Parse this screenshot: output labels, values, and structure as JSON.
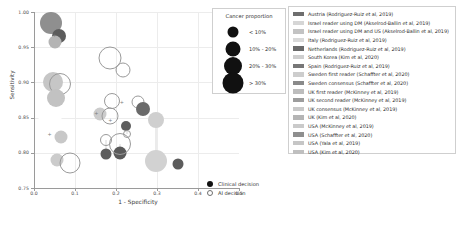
{
  "chart_data": {
    "type": "scatter",
    "title": "",
    "xlabel": "1 - Specificity",
    "ylabel": "Sensitivity",
    "xlim": [
      0.0,
      0.5
    ],
    "ylim": [
      0.75,
      1.0
    ],
    "xticks": [
      "0.0",
      "0.1",
      "0.2",
      "0.3",
      "0.4",
      "0.5"
    ],
    "xtick_values": [
      0.0,
      0.1,
      0.2,
      0.3,
      0.4,
      0.5
    ],
    "yticks": [
      "0.75",
      "0.80",
      "0.85",
      "0.90",
      "0.95",
      "1.00"
    ],
    "ytick_values": [
      0.75,
      0.8,
      0.85,
      0.9,
      0.95,
      1.0
    ],
    "grid": true,
    "legend_position": "right",
    "size_encodes": "Cancer proportion",
    "shape_encodes": "decision type",
    "points": [
      {
        "study": "Austria (Rodriguez-Ruiz et al, 2019)",
        "decision": "Clinical decision",
        "x": 0.041,
        "y": 0.985,
        "size": 22,
        "color": "#8f8f8f"
      },
      {
        "study": "Austria (Rodriguez-Ruiz et al, 2019)",
        "decision": "Clinical decision",
        "x": 0.06,
        "y": 0.966,
        "size": 14,
        "color": "#5c5c5c"
      },
      {
        "study": "Israel reader using DM (Akselrod-Ballin et al, 2019)",
        "decision": "Clinical decision",
        "x": 0.052,
        "y": 0.958,
        "size": 13,
        "color": "#b4b4b4"
      },
      {
        "study": "Israel reader using DM and US (Akselrod-Ballin et al, 2019)",
        "decision": "AI decision",
        "x": 0.186,
        "y": 0.934,
        "size": 23,
        "color": "#c9c9c9"
      },
      {
        "study": "Italy (Rodriguez-Ruiz et al, 2019)",
        "decision": "AI decision",
        "x": 0.216,
        "y": 0.918,
        "size": 15,
        "color": "#c4c4c4"
      },
      {
        "study": "Netherlands (Rodriguez-Ruiz et al, 2019)",
        "decision": "Clinical decision",
        "x": 0.047,
        "y": 0.9,
        "size": 20,
        "color": "#c6c6c6"
      },
      {
        "study": "Netherlands (Rodriguez-Ruiz et al, 2019)",
        "decision": "AI decision",
        "x": 0.064,
        "y": 0.898,
        "size": 22,
        "color": "#ffffff"
      },
      {
        "study": "South Korea (Kim et al, 2020)",
        "decision": "Clinical decision",
        "x": 0.054,
        "y": 0.878,
        "size": 18,
        "color": "#c2c2c2"
      },
      {
        "study": "Spain (Rodriguez-Ruiz et al, 2019)",
        "decision": "AI decision",
        "x": 0.191,
        "y": 0.874,
        "size": 16,
        "color": "#ffffff"
      },
      {
        "study": "Sweden first reader (Schaffter et al, 2020)",
        "decision": "AI decision",
        "x": 0.253,
        "y": 0.872,
        "size": 13,
        "color": "#ffffff"
      },
      {
        "study": "Sweden consensus (Schaffter et al, 2020)",
        "decision": "Clinical decision",
        "x": 0.266,
        "y": 0.862,
        "size": 14,
        "color": "#6a6a6a"
      },
      {
        "study": "UK first reader (McKinney et al, 2019)",
        "decision": "Clinical decision",
        "x": 0.16,
        "y": 0.855,
        "size": 13,
        "color": "#cccccc"
      },
      {
        "study": "UK second reader (McKinney et al, 2019)",
        "decision": "AI decision",
        "x": 0.186,
        "y": 0.852,
        "size": 17,
        "color": "#ffffff"
      },
      {
        "study": "UK consensus (McKinney et al, 2019)",
        "decision": "Clinical decision",
        "x": 0.04,
        "y": 0.848,
        "size": 23,
        "color": "#ffffff"
      },
      {
        "study": "UK (Kim et al, 2020)",
        "decision": "Clinical decision",
        "x": 0.225,
        "y": 0.838,
        "size": 10,
        "color": "#5e5e5e"
      },
      {
        "study": "USA (McKinney et al, 2019)",
        "decision": "AI decision",
        "x": 0.228,
        "y": 0.826,
        "size": 8,
        "color": "#ffffff"
      },
      {
        "study": "USA (Schaffter et al, 2020)",
        "decision": "Clinical decision",
        "x": 0.297,
        "y": 0.846,
        "size": 16,
        "color": "#cfcfcf"
      },
      {
        "study": "USA (Yala et al, 2019)",
        "decision": "Clinical decision",
        "x": 0.066,
        "y": 0.823,
        "size": 13,
        "color": "#c8c8c8"
      },
      {
        "study": "USA (Kim et al, 2020)",
        "decision": "AI decision",
        "x": 0.175,
        "y": 0.818,
        "size": 12,
        "color": "#ffffff"
      },
      {
        "study": "USA (Kim et al, 2020)",
        "decision": "Clinical decision",
        "x": 0.176,
        "y": 0.798,
        "size": 11,
        "color": "#5e5e5e"
      },
      {
        "study": "Sweden consensus (Schaffter et al, 2020)",
        "decision": "Clinical decision",
        "x": 0.21,
        "y": 0.8,
        "size": 13,
        "color": "#5a5a5a"
      },
      {
        "study": "UK (Kim et al, 2020)",
        "decision": "AI decision",
        "x": 0.21,
        "y": 0.812,
        "size": 22,
        "color": "#ffffff"
      },
      {
        "study": "Italy (Rodriguez-Ruiz et al, 2019)",
        "decision": "Clinical decision",
        "x": 0.056,
        "y": 0.79,
        "size": 13,
        "color": "#cbcbcb"
      },
      {
        "study": "Spain (Rodriguez-Ruiz et al, 2019)",
        "decision": "AI decision",
        "x": 0.087,
        "y": 0.786,
        "size": 21,
        "color": "#ffffff"
      },
      {
        "study": "USA (Schaffter et al, 2020)",
        "decision": "Clinical decision",
        "x": 0.297,
        "y": 0.788,
        "size": 22,
        "color": "#d2d2d2"
      },
      {
        "study": "UK second reader (McKinney et al, 2019)",
        "decision": "Clinical decision",
        "x": 0.352,
        "y": 0.784,
        "size": 11,
        "color": "#5c5c5c"
      }
    ],
    "connectors": [
      {
        "x": 0.176,
        "y1": 0.818,
        "y2": 0.798
      },
      {
        "x": 0.228,
        "y1": 0.838,
        "y2": 0.826
      },
      {
        "x": 0.266,
        "y1": 0.872,
        "y2": 0.862
      },
      {
        "x": 0.21,
        "y1": 0.812,
        "y2": 0.8
      },
      {
        "x": 0.297,
        "y1": 0.846,
        "y2": 0.788
      }
    ],
    "markers": [
      {
        "x": 0.05,
        "y": 0.968
      },
      {
        "x": 0.152,
        "y": 0.856
      },
      {
        "x": 0.214,
        "y": 0.872
      },
      {
        "x": 0.038,
        "y": 0.826
      },
      {
        "x": 0.186,
        "y": 0.846
      }
    ]
  },
  "size_legend": {
    "title": "Cancer proportion",
    "items": [
      {
        "label": "< 10%",
        "diameter": 11
      },
      {
        "label": "10% - 20%",
        "diameter": 15
      },
      {
        "label": "20% - 30%",
        "diameter": 18
      },
      {
        "label": "> 30%",
        "diameter": 21
      }
    ]
  },
  "color_legend": {
    "items": [
      {
        "label": "Austria (Rodriguez-Ruiz et al, 2019)",
        "color": "#6e6e6e"
      },
      {
        "label": "Israel reader using DM (Akselrod-Ballin et al, 2019)",
        "color": "#d6d6d6"
      },
      {
        "label": "Israel reader using DM and US (Akselrod-Ballin et al, 2019)",
        "color": "#c3c3c3"
      },
      {
        "label": "Italy (Rodriguez-Ruiz et al, 2019)",
        "color": "#d9d9d9"
      },
      {
        "label": "Netherlands (Rodriguez-Ruiz et al, 2019)",
        "color": "#6a6a6a"
      },
      {
        "label": "South Korea (Kim et al, 2020)",
        "color": "#cfcfcf"
      },
      {
        "label": "Spain (Rodriguez-Ruiz et al, 2019)",
        "color": "#777777"
      },
      {
        "label": "Sweden first reader (Schaffter et al, 2020)",
        "color": "#cdcdcd"
      },
      {
        "label": "Sweden consensus (Schaffter et al, 2020)",
        "color": "#8a8a8a"
      },
      {
        "label": "UK first reader (McKinney et al, 2019)",
        "color": "#bdbdbd"
      },
      {
        "label": "UK second reader (McKinney et al, 2019)",
        "color": "#9d9d9d"
      },
      {
        "label": "UK consensus (McKinney et al, 2019)",
        "color": "#c9c9c9"
      },
      {
        "label": "UK (Kim et al, 2020)",
        "color": "#b5b5b5"
      },
      {
        "label": "USA (McKinney et al, 2019)",
        "color": "#cacaca"
      },
      {
        "label": "USA (Schaffter et al, 2020)",
        "color": "#8f8f8f"
      },
      {
        "label": "USA (Yala et al, 2019)",
        "color": "#c6c6c6"
      },
      {
        "label": "USA (Kim et al, 2020)",
        "color": "#bfbfbf"
      }
    ]
  },
  "shape_legend": {
    "items": [
      {
        "label": "Clinical decision",
        "style": "filled"
      },
      {
        "label": "AI decision",
        "style": "open"
      }
    ]
  }
}
